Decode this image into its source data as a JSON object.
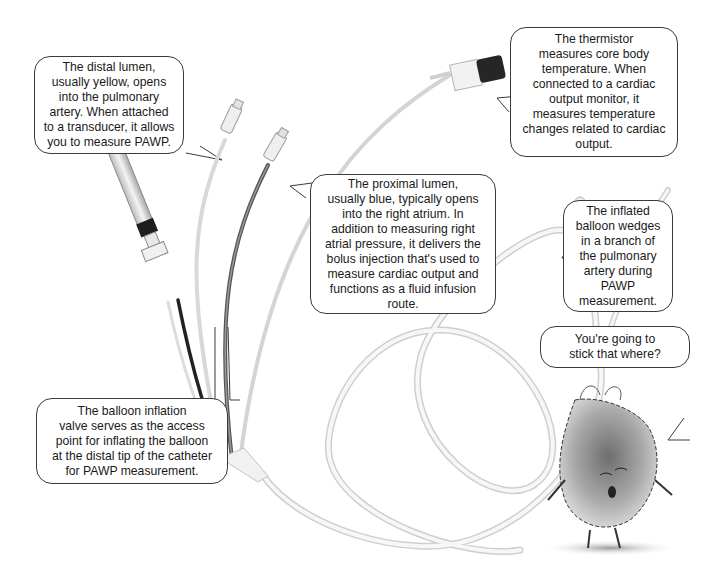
{
  "diagram": {
    "callouts": {
      "distal_lumen": "The distal lumen,\nusually yellow, opens\ninto the pulmonary\nartery. When attached\nto a transducer, it allows\nyou to measure PAWP.",
      "thermistor": "The thermistor\nmeasures core body\ntemperature. When\nconnected to a cardiac\noutput monitor, it\nmeasures temperature\nchanges related to cardiac\noutput.",
      "proximal_lumen": "The proximal lumen,\nusually blue, typically opens\ninto the right atrium. In\naddition to measuring right\natrial pressure, it delivers the\nbolus injection that's used to\nmeasure cardiac output and\nfunctions as a fluid infusion\nroute.",
      "inflated_balloon": "The inflated\nballoon wedges\nin a branch of\nthe pulmonary\nartery during\nPAWP\nmeasurement.",
      "balloon_valve": "The balloon inflation\nvalve serves as the access\npoint for inflating the balloon\nat the distal tip of the catheter\nfor PAWP measurement.",
      "heart_speech": "You're going to\nstick that where?"
    },
    "components": [
      "syringe",
      "distal-lumen-hub",
      "proximal-lumen-hub",
      "thermistor-connector",
      "catheter-junction",
      "catheter-tube",
      "balloon-tip",
      "cartoon-heart"
    ],
    "colors": {
      "bubble_border": "#3a3a3a",
      "tube": "#e6e6e6",
      "dark_tube": "#333333"
    }
  }
}
